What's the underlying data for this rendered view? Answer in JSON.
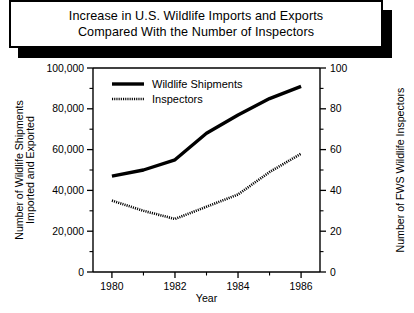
{
  "title": {
    "line1": "Increase in U.S. Wildlife Imports and Exports",
    "line2": "Compared With the Number of Inspectors"
  },
  "chart_data": {
    "type": "line",
    "title": "Increase in U.S. Wildlife Imports and Exports Compared With the Number of Inspectors",
    "xlabel": "Year",
    "ylabel": "Number of Wildlife Shipments Imported and Exported",
    "y2label": "Number of FWS Wildlife Inspectors",
    "ylabel_line1": "Number of Wildlife Shipments",
    "ylabel_line2": "Imported and Exported",
    "xlim": [
      1979.4,
      1986.6
    ],
    "ylim": [
      0,
      100000
    ],
    "y2lim": [
      0,
      100
    ],
    "grid": false,
    "legend_position": "top-left",
    "x_ticks": [
      1980,
      1982,
      1984,
      1986
    ],
    "x_tick_labels": [
      "1980",
      "1982",
      "1984",
      "1986"
    ],
    "x_minor_ticks": [
      1981,
      1983,
      1985
    ],
    "y_ticks": [
      0,
      20000,
      40000,
      60000,
      80000,
      100000
    ],
    "y_tick_labels": [
      "0",
      "20,000",
      "40,000",
      "60,000",
      "80,000",
      "100,000"
    ],
    "y_minor_ticks": [
      10000,
      30000,
      50000,
      70000,
      90000
    ],
    "y2_ticks": [
      0,
      20,
      40,
      60,
      80,
      100
    ],
    "y2_tick_labels": [
      "0",
      "20",
      "40",
      "60",
      "80",
      "100"
    ],
    "y2_minor_ticks": [
      10,
      30,
      50,
      70,
      90
    ],
    "x": [
      1980,
      1981,
      1982,
      1983,
      1984,
      1985,
      1986
    ],
    "series": [
      {
        "name": "Wildlife Shipments",
        "style": "solid",
        "axis": "left",
        "values": [
          47000,
          50000,
          55000,
          68000,
          77000,
          85000,
          91000
        ]
      },
      {
        "name": "Inspectors",
        "style": "dotted",
        "axis": "right",
        "values": [
          35,
          30,
          26,
          32,
          38,
          49,
          58
        ]
      }
    ]
  },
  "legend": {
    "items": [
      {
        "label": "Wildlife Shipments",
        "style": "solid"
      },
      {
        "label": "Inspectors",
        "style": "dotted"
      }
    ]
  }
}
